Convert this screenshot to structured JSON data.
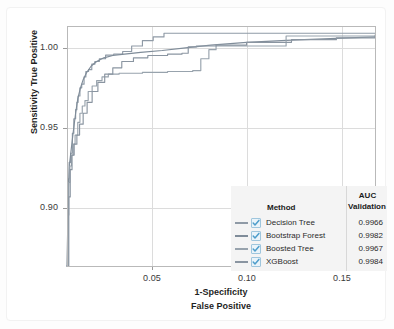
{
  "chart_data": {
    "type": "line",
    "title": "",
    "subtitle": "",
    "xlabel": "1-Specificity",
    "xlabel2": "False Positive",
    "ylabel": "Sensitivity",
    "ylabel2": "True Positive",
    "xlim": [
      0.0,
      0.1715
    ],
    "ylim": [
      0.872,
      1.004
    ],
    "xticks": [
      0.05,
      0.1,
      0.15
    ],
    "xtick_labels": [
      "0.05",
      "0.10",
      "0.15"
    ],
    "yticks": [
      0.9,
      0.95,
      1.0
    ],
    "ytick_labels": [
      "0.90",
      "0.95",
      "1.00"
    ],
    "grid": true,
    "legend_position": "bottom-right",
    "legend_columns": [
      "Method",
      "AUC",
      "Validation"
    ],
    "series": [
      {
        "name": "Decision Tree",
        "auc_validation": "0.9966",
        "color": "#8f9aa6",
        "checked": true,
        "points": [
          [
            0.0,
            0.872
          ],
          [
            0.0005,
            0.905
          ],
          [
            0.0008,
            0.92
          ],
          [
            0.0012,
            0.929
          ],
          [
            0.002,
            0.934
          ],
          [
            0.003,
            0.945
          ],
          [
            0.0038,
            0.953
          ],
          [
            0.0048,
            0.958
          ],
          [
            0.0055,
            0.962
          ],
          [
            0.0062,
            0.9655
          ],
          [
            0.0072,
            0.97
          ],
          [
            0.0082,
            0.972
          ],
          [
            0.0095,
            0.976
          ],
          [
            0.0105,
            0.979
          ],
          [
            0.012,
            0.98
          ],
          [
            0.0138,
            0.983
          ],
          [
            0.0155,
            0.9845
          ],
          [
            0.018,
            0.986
          ],
          [
            0.0215,
            0.988
          ],
          [
            0.026,
            0.9885
          ],
          [
            0.031,
            0.99
          ],
          [
            0.036,
            0.993
          ],
          [
            0.042,
            0.996
          ],
          [
            0.048,
            0.998
          ],
          [
            0.054,
            1.0
          ],
          [
            0.1715,
            1.0
          ]
        ]
      },
      {
        "name": "Bootstrap Forest",
        "auc_validation": "0.9982",
        "color": "#7f8c99",
        "checked": true,
        "points": [
          [
            0.0,
            0.872
          ],
          [
            0.0008,
            0.915
          ],
          [
            0.0014,
            0.928
          ],
          [
            0.0022,
            0.935
          ],
          [
            0.0035,
            0.946
          ],
          [
            0.0048,
            0.956
          ],
          [
            0.006,
            0.964
          ],
          [
            0.0075,
            0.97
          ],
          [
            0.009,
            0.9745
          ],
          [
            0.011,
            0.9785
          ],
          [
            0.0135,
            0.982
          ],
          [
            0.0165,
            0.9845
          ],
          [
            0.0205,
            0.9865
          ],
          [
            0.0255,
            0.9878
          ],
          [
            0.032,
            0.9885
          ],
          [
            0.041,
            0.9895
          ],
          [
            0.053,
            0.9905
          ],
          [
            0.066,
            0.992
          ],
          [
            0.08,
            0.9935
          ],
          [
            0.1,
            0.995
          ],
          [
            0.125,
            0.9962
          ],
          [
            0.15,
            0.9972
          ],
          [
            0.1715,
            0.998
          ]
        ]
      },
      {
        "name": "Boosted Tree",
        "auc_validation": "0.9967",
        "color": "#98a3ad",
        "checked": true,
        "points": [
          [
            0.0,
            0.872
          ],
          [
            0.0006,
            0.9
          ],
          [
            0.001,
            0.918
          ],
          [
            0.0016,
            0.927
          ],
          [
            0.0025,
            0.933
          ],
          [
            0.0035,
            0.939
          ],
          [
            0.0045,
            0.944
          ],
          [
            0.006,
            0.951
          ],
          [
            0.0072,
            0.956
          ],
          [
            0.0085,
            0.96
          ],
          [
            0.01,
            0.963
          ],
          [
            0.0118,
            0.968
          ],
          [
            0.014,
            0.971
          ],
          [
            0.0165,
            0.974
          ],
          [
            0.0195,
            0.976
          ],
          [
            0.023,
            0.9775
          ],
          [
            0.029,
            0.978
          ],
          [
            0.042,
            0.9785
          ],
          [
            0.056,
            0.979
          ],
          [
            0.07,
            0.9795
          ],
          [
            0.0745,
            0.986
          ],
          [
            0.079,
            0.991
          ],
          [
            0.083,
            0.993
          ],
          [
            0.119,
            0.993
          ],
          [
            0.122,
            0.9985
          ],
          [
            0.1715,
            0.999
          ]
        ]
      },
      {
        "name": "XGBoost",
        "auc_validation": "0.9984",
        "color": "#8a95a1",
        "checked": true,
        "points": [
          [
            0.0,
            0.872
          ],
          [
            0.001,
            0.91
          ],
          [
            0.0018,
            0.925
          ],
          [
            0.0028,
            0.933
          ],
          [
            0.004,
            0.939
          ],
          [
            0.0055,
            0.944
          ],
          [
            0.007,
            0.95
          ],
          [
            0.009,
            0.956
          ],
          [
            0.0112,
            0.962
          ],
          [
            0.014,
            0.968
          ],
          [
            0.0172,
            0.973
          ],
          [
            0.021,
            0.9775
          ],
          [
            0.0255,
            0.981
          ],
          [
            0.0305,
            0.9845
          ],
          [
            0.037,
            0.9865
          ],
          [
            0.045,
            0.9878
          ],
          [
            0.056,
            0.9885
          ],
          [
            0.064,
            0.989
          ],
          [
            0.0675,
            0.9925
          ],
          [
            0.072,
            0.993
          ],
          [
            0.083,
            0.9935
          ],
          [
            0.1,
            0.995
          ],
          [
            0.125,
            0.9965
          ],
          [
            0.15,
            0.9975
          ],
          [
            0.1715,
            0.9982
          ]
        ]
      }
    ]
  },
  "legend": {
    "header_method": "Method",
    "header_auc": "AUC",
    "header_validation": "Validation",
    "rows": [
      {
        "method": "Decision Tree",
        "auc": "0.9966"
      },
      {
        "method": "Bootstrap Forest",
        "auc": "0.9982"
      },
      {
        "method": "Boosted Tree",
        "auc": "0.9967"
      },
      {
        "method": "XGBoost",
        "auc": "0.9984"
      }
    ]
  },
  "axes": {
    "y_title_line1": "Sensitivity",
    "y_title_line2": "True Positive",
    "x_title_line1": "1-Specificity",
    "x_title_line2": "False Positive",
    "ytick_0": "1.00",
    "ytick_1": "0.95",
    "ytick_2": "0.90",
    "xtick_0": "0.05",
    "xtick_1": "0.10",
    "xtick_2": "0.15"
  },
  "colors": {
    "grid": "#dcdcdc",
    "frame": "#b9b9b9",
    "legend_bg": "#f4f4f4",
    "text": "#2a2a2a",
    "checkbox_fill": "#eaf4fa",
    "checkbox_border": "#9fc6dd",
    "check_mark": "#4f9ecb"
  }
}
